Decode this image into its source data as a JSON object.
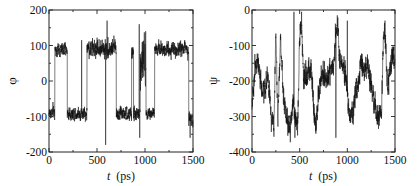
{
  "chart_data": [
    {
      "type": "line",
      "title": "",
      "xlabel": "t (ps)",
      "xlabel_italic_part": "t",
      "xlabel_unit": "(ps)",
      "ylabel": "φ",
      "xlim": [
        0,
        1500
      ],
      "ylim": [
        -200,
        200
      ],
      "x_ticks": [
        0,
        500,
        1000,
        1500
      ],
      "y_ticks": [
        -200,
        -100,
        0,
        100,
        200
      ],
      "x_minor_step": 250,
      "y_minor_step": 50,
      "grid": false,
      "legend": null,
      "color": "#111111",
      "description": "Backbone dihedral phi vs time; two-state hopping between about +90 and -90 degrees",
      "segments": [
        {
          "t0": 0,
          "t1": 60,
          "mean": -90,
          "noise": 18
        },
        {
          "t0": 60,
          "t1": 190,
          "mean": 88,
          "noise": 15
        },
        {
          "t0": 190,
          "t1": 395,
          "mean": -92,
          "noise": 16
        },
        {
          "t0": 395,
          "t1": 700,
          "mean": 92,
          "noise": 22
        },
        {
          "t0": 700,
          "t1": 760,
          "mean": -90,
          "noise": 18
        },
        {
          "t0": 760,
          "t1": 860,
          "mean": -95,
          "noise": 16
        },
        {
          "t0": 860,
          "t1": 880,
          "mean": 80,
          "noise": 20
        },
        {
          "t0": 880,
          "t1": 950,
          "mean": -92,
          "noise": 16
        },
        {
          "t0": 950,
          "t1": 1010,
          "mean": 60,
          "noise": 60
        },
        {
          "t0": 1010,
          "t1": 1100,
          "mean": -90,
          "noise": 16
        },
        {
          "t0": 1100,
          "t1": 1455,
          "mean": 90,
          "noise": 18
        },
        {
          "t0": 1455,
          "t1": 1500,
          "mean": -105,
          "noise": 18
        }
      ],
      "spikes": [
        {
          "t": 340,
          "y": 115
        },
        {
          "t": 590,
          "y": -180
        },
        {
          "t": 605,
          "y": 170
        },
        {
          "t": 940,
          "y": 160
        },
        {
          "t": 945,
          "y": -160
        },
        {
          "t": 1470,
          "y": -160
        }
      ]
    },
    {
      "type": "line",
      "title": "",
      "xlabel": "t (ps)",
      "xlabel_italic_part": "t",
      "xlabel_unit": "(ps)",
      "ylabel": "ψ",
      "xlim": [
        0,
        1500
      ],
      "ylim": [
        -400,
        0
      ],
      "x_ticks": [
        0,
        500,
        1000,
        1500
      ],
      "y_ticks": [
        -400,
        -300,
        -200,
        -100,
        0
      ],
      "x_minor_step": 250,
      "y_minor_step": 50,
      "grid": false,
      "legend": null,
      "color": "#111111",
      "description": "Backbone dihedral psi vs time; fluctuates between about -350 and 0, mean near -200",
      "keyframes": [
        [
          0,
          -270
        ],
        [
          30,
          -160
        ],
        [
          60,
          -140
        ],
        [
          90,
          -210
        ],
        [
          130,
          -230
        ],
        [
          160,
          -180
        ],
        [
          200,
          -290
        ],
        [
          230,
          -320
        ],
        [
          250,
          -60
        ],
        [
          270,
          -300
        ],
        [
          300,
          -80
        ],
        [
          330,
          -240
        ],
        [
          360,
          -300
        ],
        [
          400,
          -330
        ],
        [
          430,
          -270
        ],
        [
          450,
          -290
        ],
        [
          480,
          -320
        ],
        [
          500,
          -60
        ],
        [
          520,
          -40
        ],
        [
          540,
          -200
        ],
        [
          580,
          -190
        ],
        [
          620,
          -160
        ],
        [
          650,
          -290
        ],
        [
          670,
          -330
        ],
        [
          700,
          -230
        ],
        [
          740,
          -180
        ],
        [
          780,
          -200
        ],
        [
          820,
          -170
        ],
        [
          860,
          -150
        ],
        [
          880,
          -60
        ],
        [
          900,
          -40
        ],
        [
          920,
          -150
        ],
        [
          960,
          -160
        ],
        [
          990,
          -200
        ],
        [
          1020,
          -290
        ],
        [
          1050,
          -300
        ],
        [
          1080,
          -240
        ],
        [
          1120,
          -200
        ],
        [
          1150,
          -140
        ],
        [
          1180,
          -180
        ],
        [
          1210,
          -150
        ],
        [
          1240,
          -200
        ],
        [
          1270,
          -250
        ],
        [
          1300,
          -280
        ],
        [
          1330,
          -300
        ],
        [
          1360,
          -290
        ],
        [
          1380,
          -60
        ],
        [
          1400,
          -80
        ],
        [
          1420,
          -220
        ],
        [
          1450,
          -160
        ],
        [
          1480,
          -120
        ],
        [
          1500,
          -150
        ]
      ],
      "noise": 28,
      "spikes": [
        {
          "t": 440,
          "y": -5
        },
        {
          "t": 450,
          "y": -360
        },
        {
          "t": 520,
          "y": -5
        },
        {
          "t": 880,
          "y": -360
        },
        {
          "t": 895,
          "y": -15
        },
        {
          "t": 1000,
          "y": -30
        },
        {
          "t": 1395,
          "y": -30
        }
      ]
    }
  ]
}
